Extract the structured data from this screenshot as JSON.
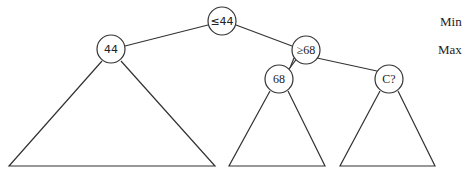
{
  "diagram": {
    "type": "minimax-tree",
    "nodes": {
      "root": {
        "label": "≤44",
        "level": "Min"
      },
      "left": {
        "label": "44"
      },
      "right": {
        "label": "≥68",
        "level": "Max"
      },
      "right_left": {
        "label": "68"
      },
      "right_right": {
        "label": "C?"
      }
    },
    "level_labels": {
      "min": "Min",
      "max": "Max"
    }
  }
}
